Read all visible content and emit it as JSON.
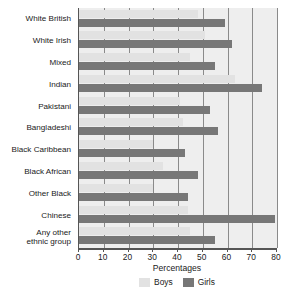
{
  "chart_data": {
    "type": "bar",
    "orientation": "horizontal",
    "title": "",
    "xlabel": "Percentages",
    "ylabel": "",
    "xlim": [
      0,
      80
    ],
    "xticks": [
      0,
      10,
      20,
      30,
      40,
      50,
      60,
      70,
      80
    ],
    "xtick_labels": [
      "0",
      "10",
      "20",
      "30",
      "40",
      "50",
      "60",
      "70",
      "80"
    ],
    "grid": true,
    "grid_axis": "x",
    "legend_position": "bottom",
    "categories": [
      "White British",
      "White Irish",
      "Mixed",
      "Indian",
      "Pakistani",
      "Bangladeshi",
      "Black Caribbean",
      "Black African",
      "Other Black",
      "Chinese",
      "Any other\nethnic group"
    ],
    "series": [
      {
        "name": "Boys",
        "color": "#e2e2e2",
        "values": [
          48,
          51,
          45,
          63,
          41,
          42,
          30,
          34,
          30,
          44,
          45
        ]
      },
      {
        "name": "Girls",
        "color": "#777777",
        "values": [
          59,
          62,
          55,
          74,
          53,
          56,
          43,
          48,
          44,
          79,
          55
        ]
      }
    ]
  },
  "legend": {
    "items": [
      {
        "label": "Boys",
        "swatch": "boys-swatch"
      },
      {
        "label": "Girls",
        "swatch": "girls-swatch"
      }
    ]
  },
  "colors": {
    "boys": "#e2e2e2",
    "girls": "#777777",
    "plot_background": "#eeeeee",
    "axis": "#555555",
    "gridline": "#8a8a8a",
    "text": "#1a1a1a"
  }
}
